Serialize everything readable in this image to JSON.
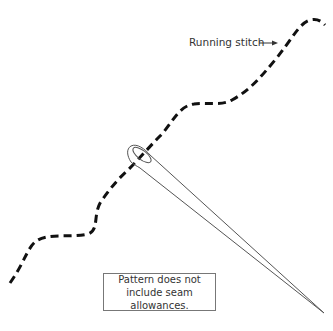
{
  "diagram": {
    "stitch_label": "Running stitch",
    "note_lines": [
      "Pattern does not",
      "include seam allowances."
    ],
    "colors": {
      "stitch": "#111111",
      "needle_outline": "#555555",
      "text": "#333333",
      "box_border": "#777777"
    }
  }
}
